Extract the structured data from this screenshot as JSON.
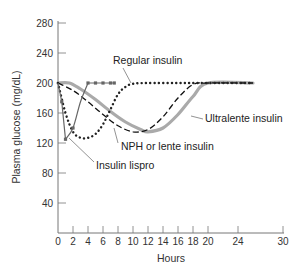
{
  "chart_data": {
    "type": "line",
    "title": "",
    "xlabel": "Hours",
    "ylabel": "Plasma glucose (mg/dL)",
    "xlim": [
      0,
      30
    ],
    "ylim": [
      0,
      280
    ],
    "x_ticks": [
      0,
      2,
      4,
      6,
      8,
      10,
      12,
      14,
      16,
      18,
      20,
      24,
      30
    ],
    "y_ticks": [
      40,
      80,
      120,
      160,
      200,
      240,
      280
    ],
    "grid": false,
    "legend": "none (inline annotations)",
    "series": [
      {
        "name": "Insulin lispro",
        "style": "solid thin line with square markers",
        "color": "#666666",
        "x": [
          0,
          0.5,
          1,
          2,
          3,
          4,
          5,
          6,
          7,
          7.5
        ],
        "y": [
          200,
          175,
          125,
          140,
          175,
          200,
          200,
          200,
          200,
          200
        ]
      },
      {
        "name": "Regular insulin",
        "style": "dotted",
        "color": "#222222",
        "x": [
          0,
          1,
          2,
          3,
          4,
          5,
          6,
          7,
          8,
          9,
          10,
          12,
          16,
          20,
          26
        ],
        "y": [
          200,
          160,
          135,
          127,
          127,
          132,
          145,
          165,
          185,
          195,
          199,
          200,
          200,
          200,
          200
        ]
      },
      {
        "name": "NPH or lente insulin",
        "style": "dashed",
        "color": "#111111",
        "x": [
          0,
          2,
          4,
          6,
          8,
          10,
          12,
          14,
          16,
          18,
          20,
          26
        ],
        "y": [
          200,
          190,
          175,
          158,
          143,
          135,
          138,
          155,
          180,
          198,
          200,
          200
        ]
      },
      {
        "name": "Ultralente insulin",
        "style": "thick solid",
        "color": "#aaaaaa",
        "x": [
          0,
          1.5,
          3,
          5,
          7,
          9,
          11,
          12,
          14,
          16,
          18,
          20,
          26
        ],
        "y": [
          200,
          200,
          192,
          178,
          162,
          148,
          138,
          135,
          140,
          158,
          182,
          200,
          200
        ]
      }
    ],
    "annotations": [
      {
        "text": "Regular insulin",
        "target_series": "Regular insulin"
      },
      {
        "text": "Ultralente insulin",
        "target_series": "Ultralente insulin"
      },
      {
        "text": "NPH or lente insulin",
        "target_series": "NPH or lente insulin"
      },
      {
        "text": "Insulin lispro",
        "target_series": "Insulin lispro"
      }
    ]
  },
  "labels": {
    "xlabel": "Hours",
    "ylabel": "Plasma glucose (mg/dL)",
    "regular": "Regular insulin",
    "ultralente": "Ultralente insulin",
    "nph": "NPH or lente insulin",
    "lispro": "Insulin lispro"
  }
}
